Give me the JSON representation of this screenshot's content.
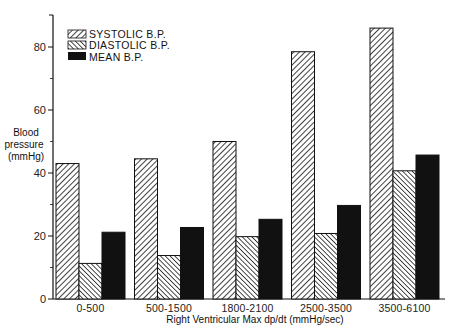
{
  "chart_data": {
    "type": "bar",
    "title": "",
    "xlabel": "Right Ventricular Max dp/dt (mmHg/sec)",
    "ylabel": [
      "Blood",
      "pressure",
      "(mmHg)"
    ],
    "ylim": [
      0,
      90
    ],
    "yticks": [
      0,
      20,
      40,
      60,
      80
    ],
    "yminor": [
      10,
      30,
      50,
      70
    ],
    "grid": false,
    "legend_position": "top-left",
    "categories": [
      "0-500",
      "500-1500",
      "1800-2100",
      "2500-3500",
      "3500-6100"
    ],
    "series": [
      {
        "name": "SYSTOLIC B.P.",
        "pattern": "hatch-forward",
        "values": [
          43,
          44.5,
          50,
          78.5,
          86
        ]
      },
      {
        "name": "DIASTOLIC B.P.",
        "pattern": "hatch-back",
        "values": [
          11.3,
          13.8,
          19.8,
          20.8,
          40.7
        ]
      },
      {
        "name": "MEAN B.P.",
        "pattern": "solid",
        "values": [
          21.2,
          22.7,
          25.3,
          29.7,
          45.7
        ]
      }
    ],
    "colors": {
      "ink": "#111111",
      "background": "#ffffff"
    }
  }
}
